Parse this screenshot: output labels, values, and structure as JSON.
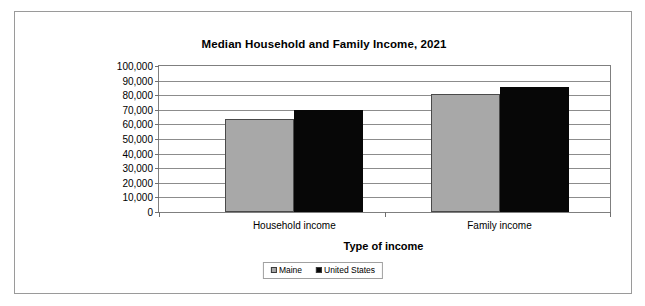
{
  "chart_data": {
    "type": "bar",
    "title": "Median Household and Family Income, 2021",
    "xlabel": "Type of income",
    "ylabel": "Dollars",
    "categories": [
      "Household income",
      "Family income"
    ],
    "series": [
      {
        "name": "Maine",
        "color": "#a8a8a8",
        "values": [
          64000,
          81000
        ]
      },
      {
        "name": "United States",
        "color": "#070707",
        "values": [
          69700,
          85800
        ]
      }
    ],
    "ylim": [
      0,
      100000
    ],
    "ytick_values": [
      0,
      10000,
      20000,
      30000,
      40000,
      50000,
      60000,
      70000,
      80000,
      90000,
      100000
    ],
    "ytick_labels": [
      "0",
      "10,000",
      "20,000",
      "30,000",
      "40,000",
      "50,000",
      "60,000",
      "70,000",
      "80,000",
      "90,000",
      "100,000"
    ],
    "grid": "horizontal",
    "legend_position": "bottom-center"
  },
  "legend": {
    "items": [
      {
        "label": "Maine"
      },
      {
        "label": "United States"
      }
    ]
  }
}
